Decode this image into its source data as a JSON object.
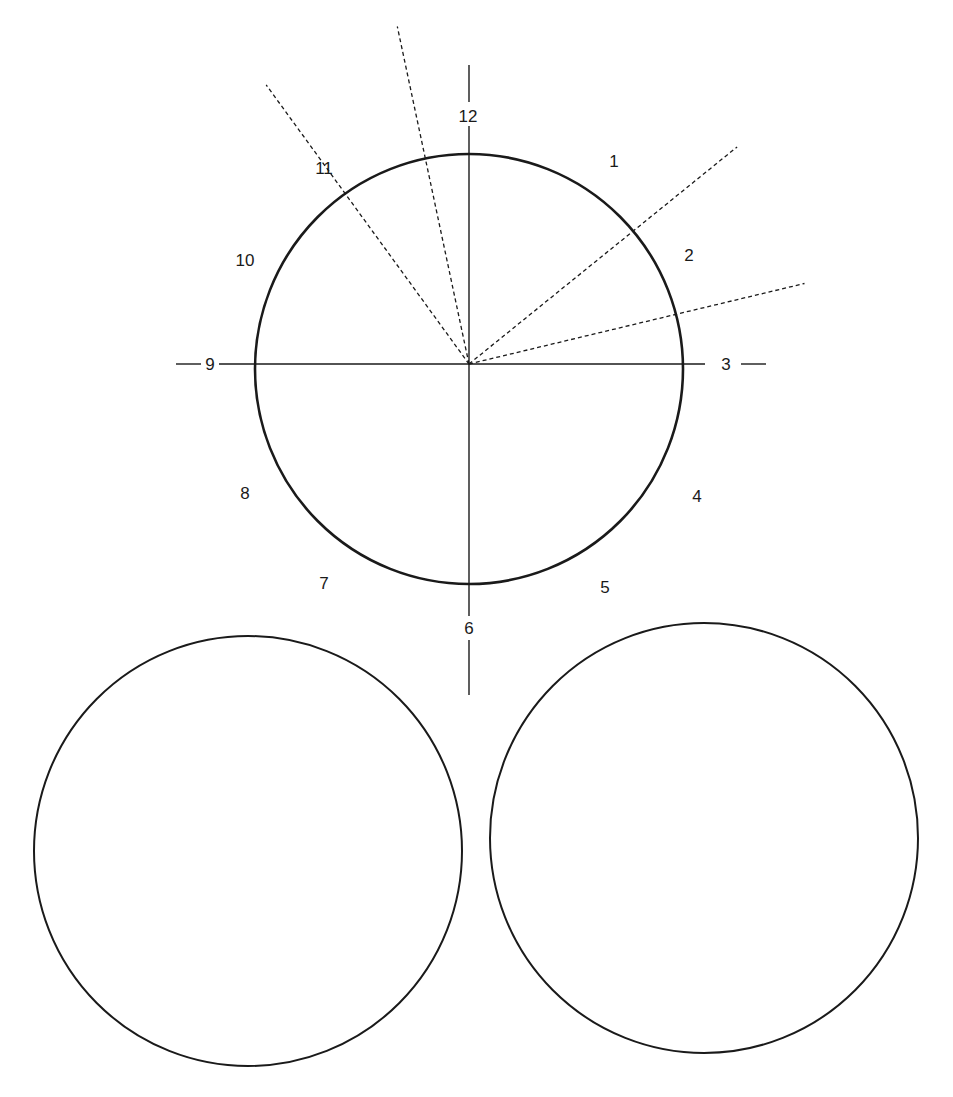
{
  "diagram": {
    "title": "",
    "clock_face": {
      "hour_labels": [
        "12",
        "1",
        "2",
        "3",
        "4",
        "5",
        "6",
        "7",
        "8",
        "9",
        "10",
        "11"
      ],
      "axes": [
        "vertical 12-6 axis",
        "horizontal 9-3 axis"
      ],
      "dashed_rays": [
        {
          "name": "ray-near-12",
          "direction_hours": 11.6
        },
        {
          "name": "ray-near-11",
          "direction_hours": 10.8
        },
        {
          "name": "ray-near-2",
          "direction_hours": 1.7
        },
        {
          "name": "ray-near-3",
          "direction_hours": 2.55
        }
      ]
    },
    "blank_circles": [
      {
        "name": "blank-circle-left"
      },
      {
        "name": "blank-circle-right"
      }
    ],
    "colors": {
      "stroke": "#1a1a1a",
      "background": "#ffffff"
    }
  }
}
